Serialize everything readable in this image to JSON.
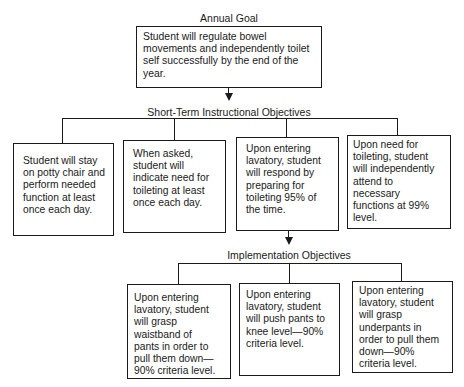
{
  "annual_goal": {
    "heading": "Annual Goal",
    "text": "Student will regulate bowel\nmovements and independently toilet\nself successfully by the end of the\nyear."
  },
  "short_term": {
    "heading": "Short-Term Instructional Objectives",
    "boxes": [
      {
        "text": "Student will stay\non potty chair and\nperform needed\nfunction at least\nonce each day."
      },
      {
        "text": "When asked,\nstudent will\nindicate need for\ntoileting at least\nonce each day."
      },
      {
        "text": "Upon entering\nlavatory, student\nwill respond by\npreparing for\ntoileting 95% of\nthe time."
      },
      {
        "text": "Upon need for\ntoileting, student\nwill independently\nattend to\nnecessary\nfunctions at 99%\nlevel."
      }
    ]
  },
  "implementation": {
    "heading": "Implementation Objectives",
    "boxes": [
      {
        "text": "Upon entering\nlavatory, student\nwill grasp\nwaistband of\npants in order to\npull them down—\n90% criteria level."
      },
      {
        "text": "Upon entering\nlavatory, student\nwill push pants to\nknee level—90%\ncriteria level."
      },
      {
        "text": "Upon entering\nlavatory, student\nwill grasp\nunderpants in\norder to pull them\ndown—90%\ncriteria level."
      }
    ]
  }
}
